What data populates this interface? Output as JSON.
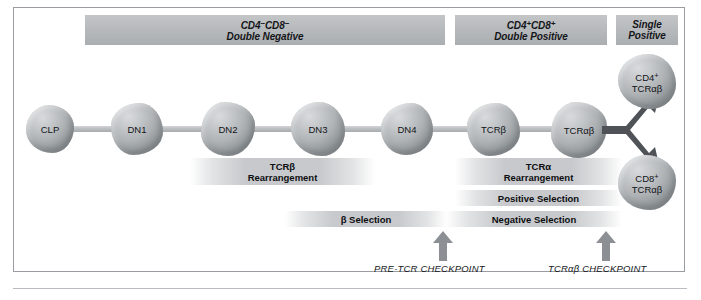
{
  "figure": {
    "frame_color": "#999ca0",
    "cell_fill": "#bcc0c3",
    "bar_fill": "#b5b8ba",
    "arrow_color": "#5f6367",
    "fork_color": "#4c5054"
  },
  "stages": [
    {
      "id": "double-negative",
      "line1_main": "CD4",
      "line1_sup1": "−",
      "line1_mid": "CD8",
      "line1_sup2": "−",
      "line2": "Double Negative"
    },
    {
      "id": "double-positive",
      "line1_main": "CD4",
      "line1_sup1": "+",
      "line1_mid": "CD8",
      "line1_sup2": "+",
      "line2": "Double Positive"
    },
    {
      "id": "single-positive",
      "line1_main": "Single",
      "line1_sup1": "",
      "line1_mid": "",
      "line1_sup2": "",
      "line2": "Positive"
    }
  ],
  "cells": [
    {
      "id": "clp",
      "label": "CLP"
    },
    {
      "id": "dn1",
      "label": "DN1"
    },
    {
      "id": "dn2",
      "label": "DN2"
    },
    {
      "id": "dn3",
      "label": "DN3"
    },
    {
      "id": "dn4",
      "label": "DN4"
    },
    {
      "id": "tcrb",
      "label": "TCRβ"
    },
    {
      "id": "tcrab",
      "label": "TCRαβ"
    }
  ],
  "output_cells": [
    {
      "id": "cd4-sp",
      "line1": "CD4",
      "sup": "+",
      "line2": "TCRαβ"
    },
    {
      "id": "cd8-sp",
      "line1": "CD8",
      "sup": "+",
      "line2": "TCRαβ"
    }
  ],
  "processes": [
    {
      "id": "tcrb-rearrangement",
      "line1": "TCRβ",
      "line2": "Rearrangement"
    },
    {
      "id": "tcra-rearrangement",
      "line1": "TCRα",
      "line2": "Rearrangement"
    },
    {
      "id": "positive-selection",
      "line1": "Positive Selection",
      "line2": ""
    },
    {
      "id": "beta-selection",
      "line1": "β Selection",
      "line2": ""
    },
    {
      "id": "negative-selection",
      "line1": "Negative Selection",
      "line2": ""
    }
  ],
  "checkpoints": [
    {
      "id": "pre-tcr-checkpoint",
      "label": "PRE-TCR CHECKPOINT"
    },
    {
      "id": "tcrab-checkpoint",
      "label": "TCRαβ CHECKPOINT"
    }
  ]
}
